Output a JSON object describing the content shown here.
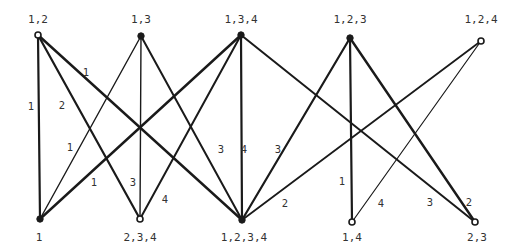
{
  "diagram": {
    "type": "bipartite-graph",
    "colors": {
      "edge": "#1a1a1a",
      "node": "#1a1a1a",
      "text": "#333333",
      "background": "#ffffff"
    },
    "top_nodes": [
      {
        "id": "t12",
        "label": "1,2",
        "x": 38,
        "y": 35,
        "lx": 38,
        "ly": 20,
        "style": "hollow"
      },
      {
        "id": "t13",
        "label": "1,3",
        "x": 141,
        "y": 36,
        "lx": 141,
        "ly": 20,
        "style": "filled"
      },
      {
        "id": "t134",
        "label": "1,3,4",
        "x": 241,
        "y": 35,
        "lx": 241,
        "ly": 20,
        "style": "filled"
      },
      {
        "id": "t123",
        "label": "1,2,3",
        "x": 350,
        "y": 38,
        "lx": 350,
        "ly": 20,
        "style": "filled"
      },
      {
        "id": "t124",
        "label": "1,2,4",
        "x": 481,
        "y": 41,
        "lx": 481,
        "ly": 20,
        "style": "hollow"
      }
    ],
    "bottom_nodes": [
      {
        "id": "b1",
        "label": "1",
        "x": 40,
        "y": 219,
        "lx": 39,
        "ly": 238,
        "style": "filled"
      },
      {
        "id": "b234",
        "label": "2,3,4",
        "x": 140,
        "y": 219,
        "lx": 140,
        "ly": 238,
        "style": "hollow"
      },
      {
        "id": "b1234",
        "label": "1,2,3,4",
        "x": 242,
        "y": 220,
        "lx": 244,
        "ly": 238,
        "style": "filled"
      },
      {
        "id": "b14",
        "label": "1,4",
        "x": 352,
        "y": 222,
        "lx": 352,
        "ly": 238,
        "style": "hollow"
      },
      {
        "id": "b23",
        "label": "2,3",
        "x": 475,
        "y": 222,
        "lx": 477,
        "ly": 238,
        "style": "hollow"
      }
    ],
    "edges": [
      {
        "from": "t12",
        "to": "b1",
        "label": "1",
        "lx": 31,
        "ly": 107,
        "w": 2.2
      },
      {
        "from": "t12",
        "to": "b234",
        "label": "2",
        "lx": 62,
        "ly": 106,
        "w": 2.2
      },
      {
        "from": "t12",
        "to": "b1234",
        "label": "1",
        "lx": 86,
        "ly": 73,
        "w": 2.4
      },
      {
        "from": "t13",
        "to": "b1",
        "label": "1",
        "lx": 70,
        "ly": 148,
        "w": 1.4
      },
      {
        "from": "t13",
        "to": "b234",
        "label": "3",
        "lx": 133,
        "ly": 183,
        "w": 1.4
      },
      {
        "from": "t13",
        "to": "b1234",
        "label": "3",
        "lx": 221,
        "ly": 150,
        "w": 2.0
      },
      {
        "from": "t134",
        "to": "b1",
        "label": "1",
        "lx": 94,
        "ly": 183,
        "w": 2.4
      },
      {
        "from": "t134",
        "to": "b234",
        "label": "4",
        "lx": 165,
        "ly": 200,
        "w": 2.0
      },
      {
        "from": "t134",
        "to": "b1234",
        "label": "4",
        "lx": 244,
        "ly": 150,
        "w": 2.2
      },
      {
        "from": "t134",
        "to": "b23",
        "label": "3",
        "lx": 430,
        "ly": 203,
        "w": 2.0
      },
      {
        "from": "t123",
        "to": "b1234",
        "label": "3",
        "lx": 278,
        "ly": 150,
        "w": 2.2
      },
      {
        "from": "t123",
        "to": "b14",
        "label": "1",
        "lx": 342,
        "ly": 182,
        "w": 2.2
      },
      {
        "from": "t123",
        "to": "b23",
        "label": "2",
        "lx": 469,
        "ly": 203,
        "w": 2.4
      },
      {
        "from": "t124",
        "to": "b1234",
        "label": "2",
        "lx": 285,
        "ly": 204,
        "w": 1.8
      },
      {
        "from": "t124",
        "to": "b14",
        "label": "4",
        "lx": 381,
        "ly": 204,
        "w": 1.2
      }
    ]
  }
}
